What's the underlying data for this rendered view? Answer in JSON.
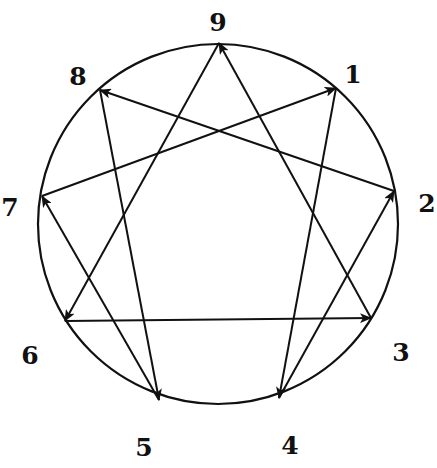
{
  "diagram": {
    "type": "enneagram",
    "circle": {
      "cx": 218,
      "cy": 224,
      "r": 180
    },
    "colors": {
      "stroke": "#111111",
      "background": "#ffffff"
    },
    "points": [
      {
        "id": "9",
        "label": "9",
        "x": 219,
        "y": 43,
        "lx": 218,
        "ly": 24
      },
      {
        "id": "1",
        "label": "1",
        "x": 336,
        "y": 88,
        "lx": 353,
        "ly": 76
      },
      {
        "id": "2",
        "label": "2",
        "x": 394,
        "y": 191,
        "lx": 427,
        "ly": 205
      },
      {
        "id": "3",
        "label": "3",
        "x": 371,
        "y": 318,
        "lx": 401,
        "ly": 354
      },
      {
        "id": "4",
        "label": "4",
        "x": 279,
        "y": 398,
        "lx": 290,
        "ly": 447
      },
      {
        "id": "5",
        "label": "5",
        "x": 159,
        "y": 400,
        "lx": 144,
        "ly": 449
      },
      {
        "id": "6",
        "label": "6",
        "x": 65,
        "y": 321,
        "lx": 30,
        "ly": 357
      },
      {
        "id": "7",
        "label": "7",
        "x": 42,
        "y": 196,
        "lx": 10,
        "ly": 209
      },
      {
        "id": "8",
        "label": "8",
        "x": 100,
        "y": 90,
        "lx": 78,
        "ly": 78
      }
    ],
    "edges": [
      {
        "from": "1",
        "to": "4"
      },
      {
        "from": "4",
        "to": "2"
      },
      {
        "from": "2",
        "to": "8"
      },
      {
        "from": "8",
        "to": "5"
      },
      {
        "from": "5",
        "to": "7"
      },
      {
        "from": "7",
        "to": "1"
      },
      {
        "from": "9",
        "to": "6"
      },
      {
        "from": "6",
        "to": "3"
      },
      {
        "from": "3",
        "to": "9"
      }
    ]
  }
}
